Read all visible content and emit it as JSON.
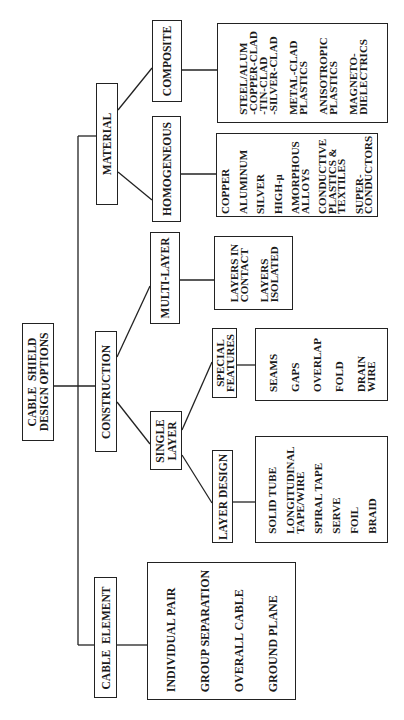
{
  "diagram": {
    "title": "CABLE  SHIELD\nDESIGN OPTIONS",
    "branches": {
      "material": {
        "label": "MATERIAL",
        "homogeneous": {
          "label": "HOMOGENEOUS",
          "items": [
            "COPPER",
            "ALUMINUM",
            "SILVER",
            "HIGH-μ",
            "AMORPHOUS\nALLOYS",
            "CONDUCTIVE\nPLASTICS &\nTEXTILES",
            "SUPER-\nCONDUCTORS"
          ]
        },
        "composite": {
          "label": "COMPOSITE",
          "items": [
            "STEEL/ALUM\n-COPPER-CLAD\n-TIN-CLAD\n-SILVER-CLAD",
            "METAL-CLAD\nPLASTICS",
            "ANISOTROPIC\nPLASTICS",
            "MAGNETO-\nDIELECTRICS"
          ]
        }
      },
      "construction": {
        "label": "CONSTRUCTION",
        "multi_layer": {
          "label": "MULTI-LAYER",
          "items": [
            "LAYERS IN\nCONTACT",
            "LAYERS\nISOLATED"
          ]
        },
        "single_layer": {
          "label": "SINGLE\nLAYER",
          "special_features": {
            "label": "SPECIAL\nFEATURES",
            "items": [
              "SEAMS",
              "GAPS",
              "OVERLAP",
              "FOLD",
              "DRAIN\nWIRE"
            ]
          },
          "layer_design": {
            "label": "LAYER DESIGN",
            "items": [
              "SOLID TUBE",
              "LONGITUDINAL\nTAPE/WIRE",
              "SPIRAL TAPE",
              "SERVE",
              "FOIL",
              "BRAID"
            ]
          }
        }
      },
      "cable_element": {
        "label": "CABLE  ELEMENT",
        "items": [
          "INDIVIDUAL PAIR",
          "GROUP SEPARATION",
          "OVERALL CABLE",
          "GROUND PLANE"
        ]
      }
    }
  }
}
